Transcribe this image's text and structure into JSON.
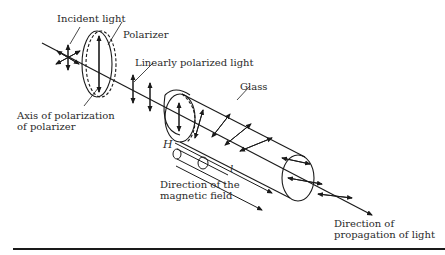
{
  "diagram": {
    "labels": {
      "incident_light": "Incident light",
      "polarizer": "Polarizer",
      "linearly_polarized_light": "Linearly polarized light",
      "glass": "Glass",
      "axis_line1": "Axis of polarization",
      "axis_line2": "of polarizer",
      "h_symbol": "H",
      "l_symbol": "l",
      "magnetic_line1": "Direction of the",
      "magnetic_line2": "magnetic field",
      "propagation_line1": "Direction of",
      "propagation_line2": "propagation of light"
    },
    "colors": {
      "line": "#1a1a1a",
      "text": "#2a2a2a",
      "background": "#ffffff"
    }
  }
}
